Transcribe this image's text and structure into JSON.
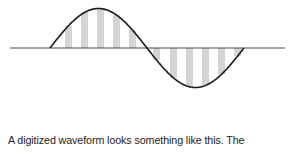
{
  "figure": {
    "axis": {
      "x1": 10,
      "x2": 285,
      "y": 48
    },
    "wave": {
      "start_x": 50,
      "end_x": 244,
      "baseline_y": 48,
      "amplitude": 39.5
    },
    "sample_bars": [
      {
        "x": 65
      },
      {
        "x": 81
      },
      {
        "x": 97
      },
      {
        "x": 113
      },
      {
        "x": 129
      },
      {
        "x": 153
      },
      {
        "x": 170
      },
      {
        "x": 186
      },
      {
        "x": 202
      },
      {
        "x": 218
      },
      {
        "x": 234
      }
    ],
    "bar_width": 7,
    "colors": {
      "curve": "#1a1a1a",
      "axis": "#333333",
      "bars": "#d4d4d4"
    }
  },
  "caption": {
    "text": "A digitized waveform looks something like this. The"
  }
}
